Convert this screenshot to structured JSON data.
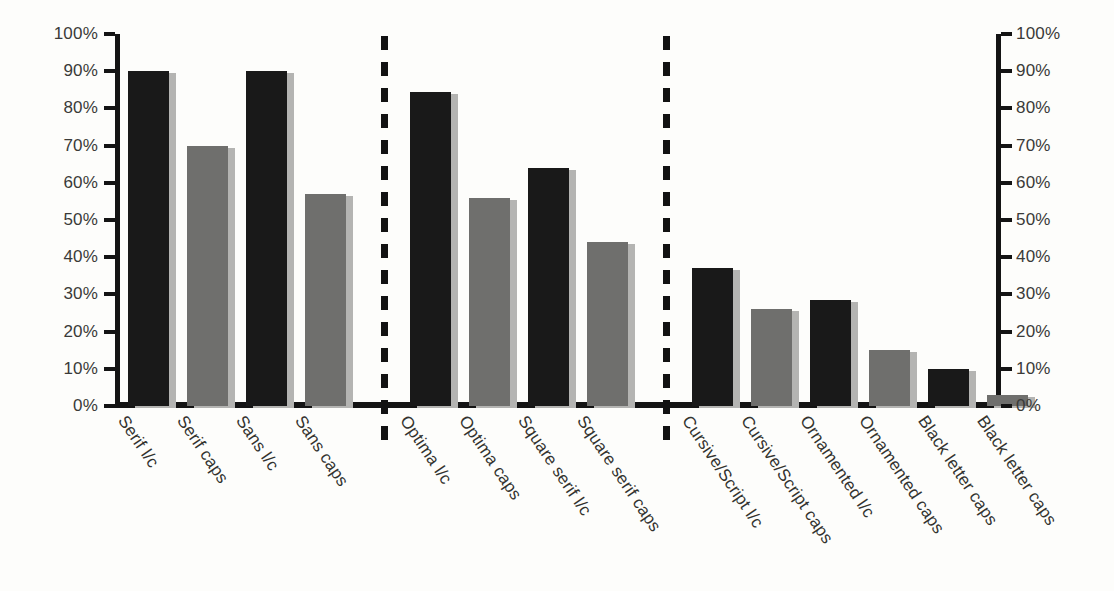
{
  "chart_data": {
    "type": "bar",
    "title": "",
    "subtitle": "",
    "xlabel": "",
    "ylabel": "",
    "ylim": [
      0,
      100
    ],
    "y_unit": "%",
    "grid": false,
    "legend": "none",
    "dual_axis": true,
    "axis_left_labels": [
      "100%",
      "90%",
      "80%",
      "70%",
      "60%",
      "50%",
      "40%",
      "30%",
      "20%",
      "10%",
      "0%"
    ],
    "axis_right_labels": [
      "100%",
      "90%",
      "80%",
      "70%",
      "60%",
      "50%",
      "40%",
      "30%",
      "20%",
      "10%",
      "0%"
    ],
    "categories": [
      "Serif l/c",
      "Serif caps",
      "Sans l/c",
      "Sans caps",
      "Optima l/c",
      "Optima caps",
      "Square serif l/c",
      "Square serif caps",
      "Cursive/Script l/c",
      "Cursive/Script caps",
      "Ornamented l/c",
      "Ornamented caps",
      "Black letter caps",
      "Black letter caps"
    ],
    "values": [
      90,
      70,
      90,
      57,
      84.5,
      56,
      64,
      44,
      37,
      26,
      28.5,
      15,
      10,
      3
    ],
    "bar_tones": [
      "dark",
      "mid",
      "dark",
      "mid",
      "dark",
      "mid",
      "dark",
      "mid",
      "dark",
      "mid",
      "dark",
      "mid",
      "dark",
      "mid"
    ],
    "groups": [
      {
        "name": "group-1",
        "categories": [
          "Serif l/c",
          "Serif caps",
          "Sans l/c",
          "Sans caps"
        ]
      },
      {
        "name": "group-2",
        "categories": [
          "Optima l/c",
          "Optima caps",
          "Square serif l/c",
          "Square serif caps"
        ]
      },
      {
        "name": "group-3",
        "categories": [
          "Cursive/Script l/c",
          "Cursive/Script caps",
          "Ornamented l/c",
          "Ornamented caps",
          "Black letter caps",
          "Black letter caps"
        ]
      }
    ],
    "dividers": [
      {
        "name": "divider-1",
        "after_category": "Sans caps"
      },
      {
        "name": "divider-2",
        "after_category": "Square serif caps"
      }
    ],
    "colors": {
      "bar_dark": "#191919",
      "bar_mid": "#6f6f6d",
      "bar_shadow": "#b4b4b2",
      "axis": "#141414",
      "tick_label": "#3a3a38",
      "category_label": "#33332f",
      "background": "#fdfdfb"
    }
  }
}
